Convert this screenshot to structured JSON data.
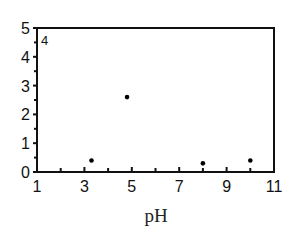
{
  "chart_data": {
    "type": "scatter",
    "title": "",
    "panel_label": "4",
    "xlabel": "pH",
    "ylabel": "",
    "xlim": [
      1,
      11
    ],
    "ylim": [
      0,
      5
    ],
    "x_ticks": [
      1,
      3,
      5,
      7,
      9,
      11
    ],
    "x_minor_ticks": [
      2,
      4,
      6,
      8,
      10
    ],
    "y_ticks": [
      0,
      1,
      2,
      3,
      4,
      5
    ],
    "y_minor_ticks": [
      0.5,
      1.5,
      2.5,
      3.5,
      4.5
    ],
    "grid": false,
    "legend": null,
    "series": [
      {
        "name": "data",
        "color": "#000000",
        "points": [
          {
            "x": 3.3,
            "y": 0.4
          },
          {
            "x": 4.8,
            "y": 2.6
          },
          {
            "x": 8.0,
            "y": 0.3
          },
          {
            "x": 10.0,
            "y": 0.4
          }
        ]
      }
    ]
  }
}
